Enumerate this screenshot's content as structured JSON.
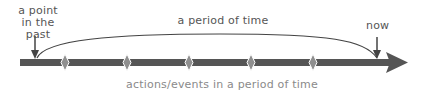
{
  "diagram": {
    "labels": {
      "point_in_past": "a point in the past",
      "period_of_time": "a period of time",
      "now": "now",
      "actions_events": "actions/events in a period of time"
    },
    "timeline": {
      "direction": "left-to-right",
      "event_marker_count": 5,
      "event_marker_shape": "diamond"
    },
    "colors": {
      "timeline_bar": "#555555",
      "event_marker": "#8f8f8f",
      "arc_and_pointers": "#444444",
      "label_text": "#555555",
      "caption_text": "#8a8a8a"
    }
  }
}
